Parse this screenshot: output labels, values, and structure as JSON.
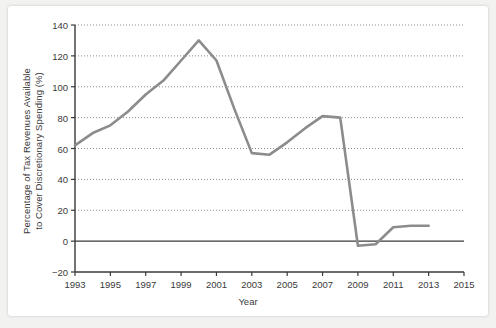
{
  "chart_data": {
    "type": "line",
    "title": "",
    "xlabel": "Year",
    "ylabel": "Percentage of Tax Revenues Available to Cover Discretionary Spending (%)",
    "ylabel_line1": "Percentage of Tax Revenues Available",
    "ylabel_line2": "to Cover Discretionary Spending (%)",
    "xlim": [
      1993,
      2015
    ],
    "ylim": [
      -20,
      140
    ],
    "xticks": [
      1993,
      1995,
      1997,
      1999,
      2001,
      2003,
      2005,
      2007,
      2009,
      2011,
      2013,
      2015
    ],
    "xtick_labels": [
      "1993",
      "1995",
      "1997",
      "1999",
      "2001",
      "2003",
      "2005",
      "2007",
      "2009",
      "2011",
      "2013",
      "2015"
    ],
    "yticks": [
      -20,
      0,
      20,
      40,
      60,
      80,
      100,
      120,
      140
    ],
    "ytick_labels": [
      "−20",
      "0",
      "20",
      "40",
      "60",
      "80",
      "100",
      "120",
      "140"
    ],
    "grid": "horizontal-dotted",
    "legend": "none",
    "zero_line": 0,
    "series": [
      {
        "name": "Percentage of Tax Revenues Available to Cover Discretionary Spending",
        "color": "#8c8c8c",
        "x": [
          1993,
          1994,
          1995,
          1996,
          1997,
          1998,
          1999,
          2000,
          2001,
          2002,
          2003,
          2004,
          2005,
          2006,
          2007,
          2008,
          2009,
          2010,
          2011,
          2012,
          2013
        ],
        "values": [
          62,
          70,
          75,
          84,
          95,
          104,
          117,
          130,
          117,
          86,
          57,
          56,
          64,
          73,
          81,
          80,
          -3,
          -2,
          9,
          10,
          10
        ]
      }
    ]
  },
  "axis": {
    "line_color": "#3a3a3a",
    "grid_color": "#8a8a8a"
  }
}
